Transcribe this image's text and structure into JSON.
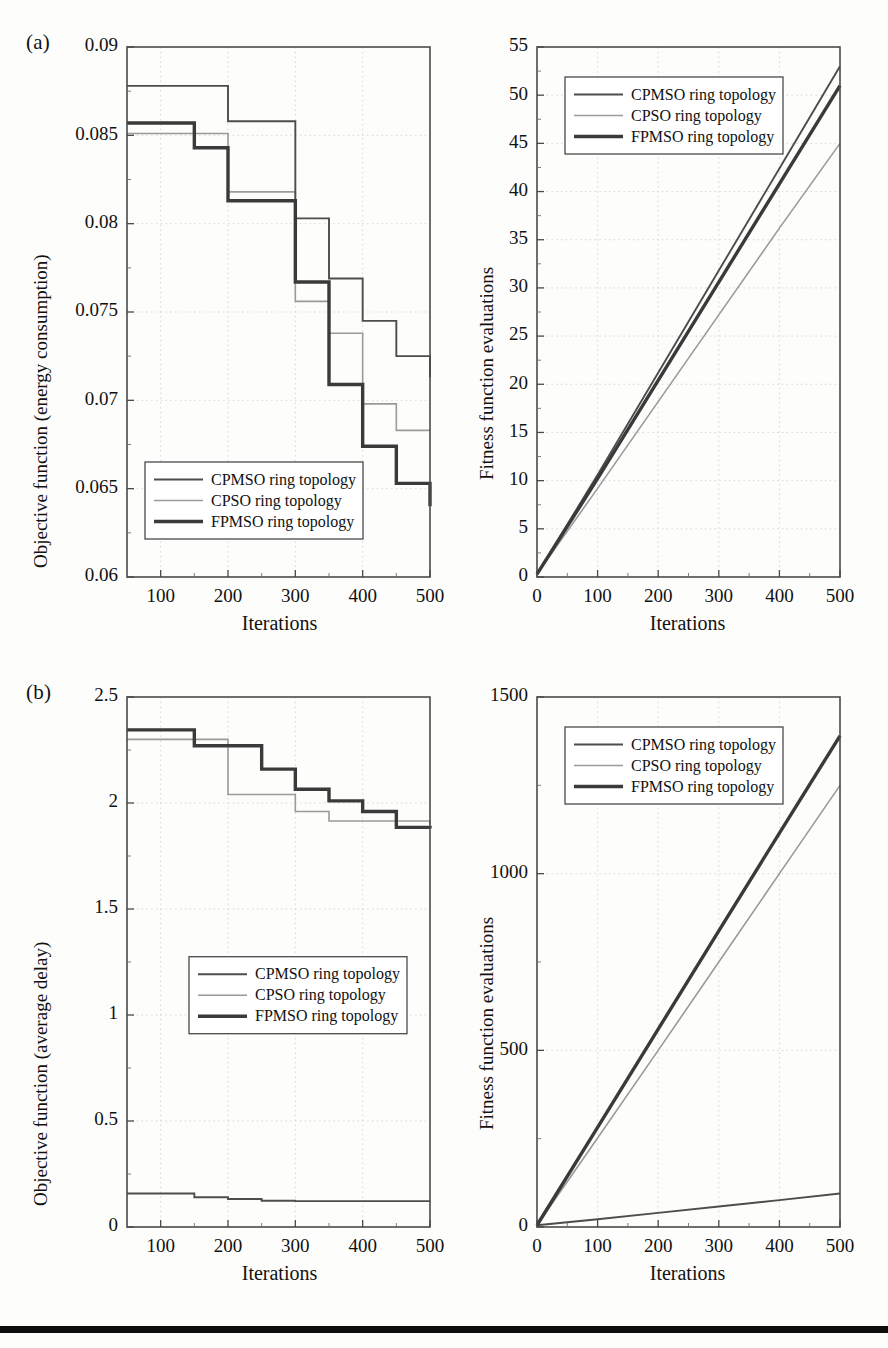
{
  "figure": {
    "panel_labels": [
      "(a)",
      "(b)"
    ],
    "bottom_rule_color": "#0d0d0d"
  },
  "series_names": {
    "cpmso": "CPMSO ring topology",
    "cpso": "CPSO ring topology",
    "fpmso": "FPMSO ring topology"
  },
  "colors": {
    "cpmso": "#4d4d4d",
    "cpso": "#9a9a9a",
    "fpmso": "#3a3a3a",
    "frame": "#4a4a4a",
    "grid": "#cfcfcf"
  },
  "chart_data": [
    {
      "id": "a-left",
      "type": "line",
      "title": "",
      "xlabel": "Iterations",
      "ylabel": "Objective function (energy consumption)",
      "xlim": [
        50,
        500
      ],
      "ylim": [
        0.06,
        0.09
      ],
      "xticks": [
        100,
        200,
        300,
        400,
        500
      ],
      "xticklabels": [
        "100",
        "200",
        "300",
        "400",
        "500"
      ],
      "yticks": [
        0.06,
        0.065,
        0.07,
        0.075,
        0.08,
        0.085,
        0.09
      ],
      "yticklabels": [
        "0.06",
        "0.065",
        "0.07",
        "0.075",
        "0.08",
        "0.085",
        "0.09"
      ],
      "grid": true,
      "legend_position": "lower-left",
      "step": true,
      "x": [
        50,
        100,
        150,
        200,
        250,
        300,
        350,
        400,
        450,
        500
      ],
      "series": [
        {
          "name": "CPMSO ring topology",
          "key": "cpmso",
          "values": [
            0.0878,
            0.0878,
            0.0878,
            0.0858,
            0.0858,
            0.0803,
            0.0769,
            0.0745,
            0.0725,
            0.0713
          ]
        },
        {
          "name": "CPSO ring topology",
          "key": "cpso",
          "values": [
            0.0851,
            0.0851,
            0.0851,
            0.0818,
            0.0818,
            0.0756,
            0.0738,
            0.0698,
            0.0683,
            0.0683
          ]
        },
        {
          "name": "FPMSO ring topology",
          "key": "fpmso",
          "values": [
            0.0857,
            0.0857,
            0.0843,
            0.0813,
            0.0813,
            0.0767,
            0.0709,
            0.0674,
            0.0653,
            0.064
          ]
        }
      ]
    },
    {
      "id": "a-right",
      "type": "line",
      "title": "",
      "xlabel": "Iterations",
      "ylabel": "Fitness function evaluations",
      "xlim": [
        0,
        500
      ],
      "ylim": [
        0,
        55
      ],
      "xticks": [
        0,
        100,
        200,
        300,
        400,
        500
      ],
      "xticklabels": [
        "0",
        "100",
        "200",
        "300",
        "400",
        "500"
      ],
      "yticks": [
        0,
        5,
        10,
        15,
        20,
        25,
        30,
        35,
        40,
        45,
        50,
        55
      ],
      "yticklabels": [
        "0",
        "5",
        "10",
        "15",
        "20",
        "25",
        "30",
        "35",
        "40",
        "45",
        "50",
        "55"
      ],
      "grid": true,
      "legend_position": "upper-left",
      "step": false,
      "x": [
        0,
        100,
        200,
        300,
        400,
        500
      ],
      "series": [
        {
          "name": "CPMSO ring topology",
          "key": "cpmso",
          "values": [
            0.3,
            10.6,
            21.2,
            31.8,
            42.4,
            53.0
          ]
        },
        {
          "name": "CPSO ring topology",
          "key": "cpso",
          "values": [
            0.3,
            9.2,
            18.2,
            27.2,
            36.2,
            45.0
          ]
        },
        {
          "name": "FPMSO ring topology",
          "key": "fpmso",
          "values": [
            0.3,
            10.2,
            20.4,
            30.6,
            40.8,
            51.0
          ]
        }
      ]
    },
    {
      "id": "b-left",
      "type": "line",
      "title": "",
      "xlabel": "Iterations",
      "ylabel": "Objective function (average delay)",
      "xlim": [
        50,
        500
      ],
      "ylim": [
        0,
        2.5
      ],
      "xticks": [
        100,
        200,
        300,
        400,
        500
      ],
      "xticklabels": [
        "100",
        "200",
        "300",
        "400",
        "500"
      ],
      "yticks": [
        0,
        0.5,
        1,
        1.5,
        2,
        2.5
      ],
      "yticklabels": [
        "0",
        "0.5",
        "1",
        "1.5",
        "2",
        "2.5"
      ],
      "grid": true,
      "legend_position": "middle",
      "step": true,
      "x": [
        50,
        100,
        150,
        200,
        250,
        300,
        350,
        400,
        450,
        500
      ],
      "series": [
        {
          "name": "CPMSO ring topology",
          "key": "cpmso",
          "values": [
            0.158,
            0.158,
            0.14,
            0.132,
            0.124,
            0.122,
            0.122,
            0.122,
            0.122,
            0.122
          ]
        },
        {
          "name": "CPSO ring topology",
          "key": "cpso",
          "values": [
            2.3,
            2.3,
            2.3,
            2.04,
            2.04,
            1.96,
            1.915,
            1.915,
            1.915,
            1.9
          ]
        },
        {
          "name": "FPMSO ring topology",
          "key": "fpmso",
          "values": [
            2.345,
            2.345,
            2.27,
            2.27,
            2.16,
            2.065,
            2.01,
            1.96,
            1.885,
            1.88
          ]
        }
      ]
    },
    {
      "id": "b-right",
      "type": "line",
      "title": "",
      "xlabel": "Iterations",
      "ylabel": "Fitness function evaluations",
      "xlim": [
        0,
        500
      ],
      "ylim": [
        0,
        1500
      ],
      "xticks": [
        0,
        100,
        200,
        300,
        400,
        500
      ],
      "xticklabels": [
        "0",
        "100",
        "200",
        "300",
        "400",
        "500"
      ],
      "yticks": [
        0,
        500,
        1000,
        1500
      ],
      "yticklabels": [
        "0",
        "500",
        "1000",
        "1500"
      ],
      "grid": true,
      "legend_position": "upper-left",
      "step": false,
      "x": [
        0,
        100,
        200,
        300,
        400,
        500
      ],
      "series": [
        {
          "name": "CPMSO ring topology",
          "key": "cpmso",
          "values": [
            5,
            22,
            40,
            58,
            76,
            95
          ]
        },
        {
          "name": "CPSO ring topology",
          "key": "cpso",
          "values": [
            5,
            252,
            500,
            750,
            1000,
            1250
          ]
        },
        {
          "name": "FPMSO ring topology",
          "key": "fpmso",
          "values": [
            5,
            282,
            560,
            838,
            1115,
            1390
          ]
        }
      ]
    }
  ]
}
